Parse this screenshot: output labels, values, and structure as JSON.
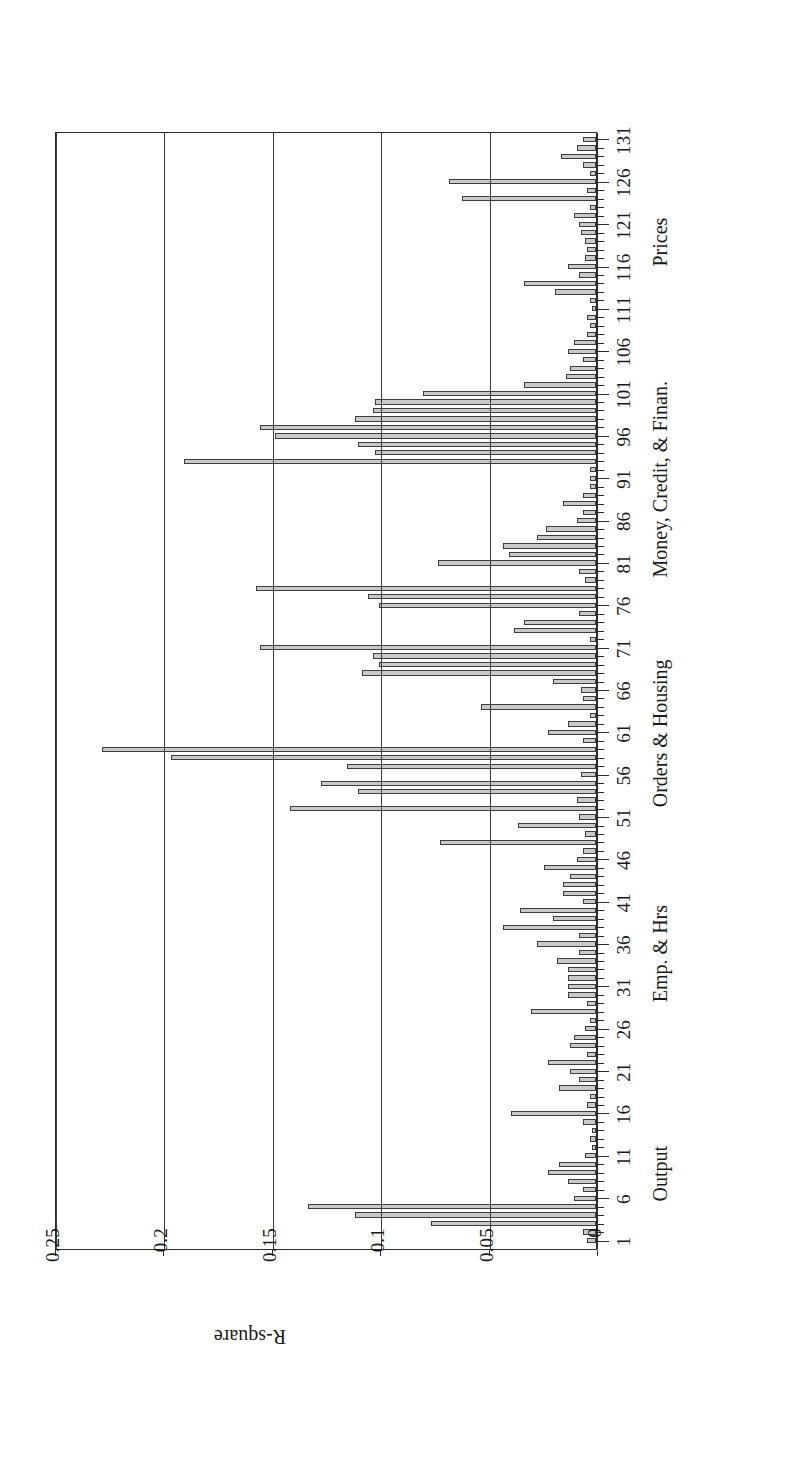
{
  "figure": {
    "orientation": "rotated-90-ccw",
    "colors": {
      "bar_fill": "#c9c9c9",
      "bar_stroke": "#3d3d3d",
      "axis": "#2b2b2b",
      "grid": "#3a3a3a"
    }
  },
  "chart_data": {
    "type": "bar",
    "title": "",
    "xlabel": "",
    "ylabel": "R-square",
    "ylim": [
      0,
      0.25
    ],
    "yticks": [
      "0",
      "0.05",
      "0.1",
      "0.15",
      "0.2",
      "0.25"
    ],
    "ytick_values": [
      0,
      0.05,
      0.1,
      0.15,
      0.2,
      0.25
    ],
    "grid": true,
    "legend": "none",
    "orientation": "vertical-bars-rotated",
    "xtick_labels": [
      "1",
      "6",
      "11",
      "16",
      "21",
      "26",
      "31",
      "36",
      "41",
      "46",
      "51",
      "56",
      "61",
      "66",
      "71",
      "76",
      "81",
      "86",
      "91",
      "96",
      "101",
      "106",
      "111",
      "116",
      "121",
      "126",
      "131"
    ],
    "xtick_values": [
      1,
      6,
      11,
      16,
      21,
      26,
      31,
      36,
      41,
      46,
      51,
      56,
      61,
      66,
      71,
      76,
      81,
      86,
      91,
      96,
      101,
      106,
      111,
      116,
      121,
      126,
      131
    ],
    "group_labels": [
      {
        "label": "Output",
        "center": 9
      },
      {
        "label": "Emp. & Hrs",
        "center": 35
      },
      {
        "label": "Orders & Housing",
        "center": 61
      },
      {
        "label": "Money, Credit, & Finan.",
        "center": 91
      },
      {
        "label": "Prices",
        "center": 119
      }
    ],
    "categories": [
      1,
      2,
      3,
      4,
      5,
      6,
      7,
      8,
      9,
      10,
      11,
      12,
      13,
      14,
      15,
      16,
      17,
      18,
      19,
      20,
      21,
      22,
      23,
      24,
      25,
      26,
      27,
      28,
      29,
      30,
      31,
      32,
      33,
      34,
      35,
      36,
      37,
      38,
      39,
      40,
      41,
      42,
      43,
      44,
      45,
      46,
      47,
      48,
      49,
      50,
      51,
      52,
      53,
      54,
      55,
      56,
      57,
      58,
      59,
      60,
      61,
      62,
      63,
      64,
      65,
      66,
      67,
      68,
      69,
      70,
      71,
      72,
      73,
      74,
      75,
      76,
      77,
      78,
      79,
      80,
      81,
      82,
      83,
      84,
      85,
      86,
      87,
      88,
      89,
      90,
      91,
      92,
      93,
      94,
      95,
      96,
      97,
      98,
      99,
      100,
      101,
      102,
      103,
      104,
      105,
      106,
      107,
      108,
      109,
      110,
      111,
      112,
      113,
      114,
      115,
      116,
      117,
      118,
      119,
      120,
      121,
      122,
      123,
      124,
      125,
      126,
      127,
      128,
      129,
      130,
      131
    ],
    "values": [
      0.004,
      0.006,
      0.076,
      0.111,
      0.133,
      0.01,
      0.006,
      0.013,
      0.022,
      0.017,
      0.005,
      0.002,
      0.003,
      0.002,
      0.006,
      0.039,
      0.004,
      0.003,
      0.017,
      0.008,
      0.012,
      0.022,
      0.004,
      0.012,
      0.01,
      0.005,
      0.003,
      0.03,
      0.004,
      0.013,
      0.013,
      0.013,
      0.013,
      0.018,
      0.008,
      0.027,
      0.008,
      0.043,
      0.02,
      0.035,
      0.006,
      0.015,
      0.015,
      0.012,
      0.024,
      0.009,
      0.006,
      0.072,
      0.005,
      0.036,
      0.008,
      0.141,
      0.009,
      0.11,
      0.127,
      0.007,
      0.115,
      0.196,
      0.228,
      0.006,
      0.022,
      0.013,
      0.003,
      0.053,
      0.006,
      0.007,
      0.02,
      0.108,
      0.1,
      0.103,
      0.155,
      0.003,
      0.038,
      0.033,
      0.008,
      0.1,
      0.105,
      0.157,
      0.005,
      0.008,
      0.073,
      0.04,
      0.043,
      0.027,
      0.023,
      0.009,
      0.006,
      0.015,
      0.006,
      0.003,
      0.003,
      0.003,
      0.19,
      0.102,
      0.11,
      0.148,
      0.155,
      0.111,
      0.103,
      0.102,
      0.08,
      0.033,
      0.014,
      0.012,
      0.006,
      0.013,
      0.01,
      0.004,
      0.003,
      0.004,
      0.002,
      0.003,
      0.019,
      0.033,
      0.008,
      0.013,
      0.005,
      0.004,
      0.005,
      0.007,
      0.008,
      0.01,
      0.003,
      0.062,
      0.004,
      0.068,
      0.003,
      0.006,
      0.016,
      0.009,
      0.006
    ]
  }
}
